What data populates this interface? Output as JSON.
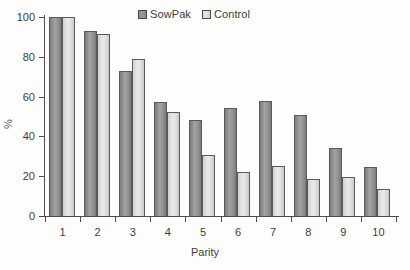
{
  "chart_data": {
    "type": "bar",
    "title": "",
    "xlabel": "Parity",
    "ylabel": "%",
    "categories": [
      "1",
      "2",
      "3",
      "4",
      "5",
      "6",
      "7",
      "8",
      "9",
      "10"
    ],
    "series": [
      {
        "name": "SowPak",
        "color": "#8f8f8f",
        "values": [
          100,
          93,
          73,
          57.5,
          48.5,
          54.5,
          58,
          51,
          34,
          24.5
        ]
      },
      {
        "name": "Control",
        "color": "#e0e0e0",
        "values": [
          100,
          91.5,
          79,
          52.5,
          30.5,
          22,
          25,
          18.5,
          19.5,
          13.5
        ]
      }
    ],
    "ylim": [
      0,
      100
    ],
    "yticks": [
      0,
      20,
      40,
      60,
      80,
      100
    ],
    "ytick_labels": [
      "0",
      "20",
      "40",
      "60",
      "80",
      "100"
    ],
    "grid": false,
    "legend_position": "top-center"
  },
  "legend": {
    "entries": [
      {
        "label": "SowPak",
        "swatch": "sowpak-swatch-icon"
      },
      {
        "label": "Control",
        "swatch": "control-swatch-icon"
      }
    ]
  },
  "axes": {
    "y_title": "%",
    "x_title": "Parity"
  }
}
